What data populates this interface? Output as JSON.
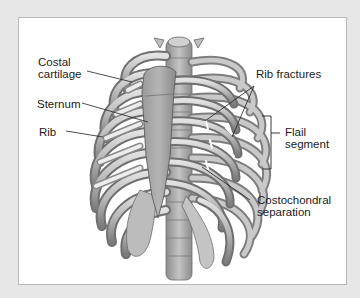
{
  "figure": {
    "colors": {
      "frame": "#e7e7e7",
      "panel": "#ffffff",
      "panel_border": "#b9b9b9",
      "bone_light": "#d4d4d4",
      "bone_mid": "#a9a9a9",
      "bone_dark": "#707070",
      "leader_line": "#222222",
      "text": "#1a1a1a"
    },
    "labels": {
      "costal_cartilage": {
        "line1": "Costal",
        "line2": "cartilage"
      },
      "sternum": "Sternum",
      "rib": "Rib",
      "rib_fractures": "Rib fractures",
      "flail_segment": {
        "line1": "Flail",
        "line2": "segment"
      },
      "costochondral_separation": {
        "line1": "Costochondral",
        "line2": "separation"
      }
    }
  }
}
